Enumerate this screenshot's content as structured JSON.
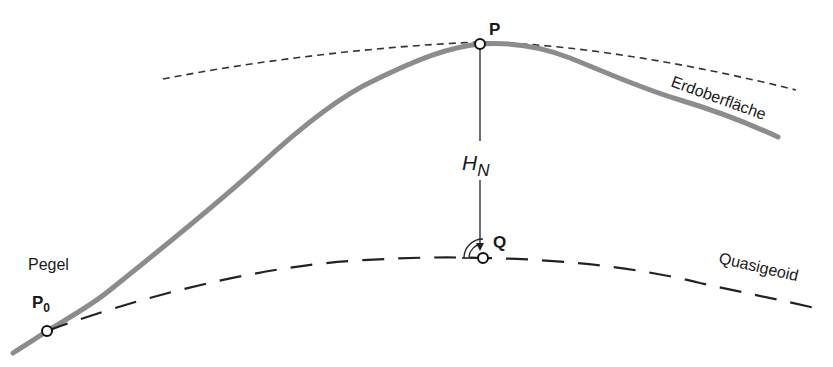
{
  "diagram": {
    "type": "geodetic-height-schematic",
    "colors": {
      "terrain": "#8c8c8c",
      "lines": "#222222",
      "text": "#1a1a1a",
      "background": "#ffffff"
    },
    "labels": {
      "point_P": "P",
      "point_Q": "Q",
      "point_P0_main": "P",
      "point_P0_sub": "0",
      "height_main": "H",
      "height_sub": "N",
      "tide_gauge": "Pegel",
      "earth_surface": "Erdoberfläche",
      "quasigeoid": "Quasigeoid"
    },
    "elements": [
      {
        "name": "earth-surface-curve",
        "style": "solid thick gray"
      },
      {
        "name": "level-surface-through-P",
        "style": "short-dashed"
      },
      {
        "name": "quasigeoid-curve",
        "style": "long-dashed"
      },
      {
        "name": "normal-height-arrow",
        "from": "P",
        "to": "Q"
      },
      {
        "name": "right-angle-marker",
        "at": "Q"
      }
    ]
  }
}
